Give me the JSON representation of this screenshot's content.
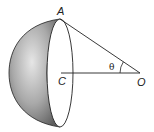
{
  "diagram": {
    "labels": {
      "A": "A",
      "C": "C",
      "O": "O",
      "angle": "θ"
    },
    "colors": {
      "shade_dark": "#6e6e6e",
      "shade_light": "#d8d8d8",
      "line": "#222222"
    }
  }
}
